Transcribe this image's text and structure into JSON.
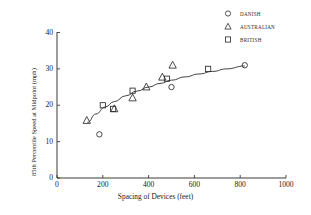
{
  "chart_data": {
    "type": "scatter",
    "title": "",
    "xlabel": "Spacing of Devices (feet)",
    "ylabel": "85th Percentile Speed at Midpoint (mph)",
    "xlim": [
      0,
      1000
    ],
    "ylim": [
      0,
      40
    ],
    "xticks": [
      0,
      200,
      400,
      600,
      800,
      1000
    ],
    "yticks": [
      0,
      10,
      20,
      30,
      40
    ],
    "xtick_labels": [
      "0",
      "200",
      "400",
      "600",
      "800",
      "1000"
    ],
    "ytick_labels": [
      "0",
      "10",
      "20",
      "30",
      "40"
    ],
    "grid": false,
    "legend_position": "top-right",
    "series": [
      {
        "name": "DANISH",
        "marker": "circle",
        "points": [
          {
            "x": 185,
            "y": 12
          },
          {
            "x": 500,
            "y": 25
          },
          {
            "x": 820,
            "y": 31
          }
        ]
      },
      {
        "name": "AUSTRALIAN",
        "marker": "triangle",
        "points": [
          {
            "x": 130,
            "y": 15.8
          },
          {
            "x": 250,
            "y": 19
          },
          {
            "x": 330,
            "y": 22
          },
          {
            "x": 390,
            "y": 25
          },
          {
            "x": 460,
            "y": 27.7
          },
          {
            "x": 505,
            "y": 31
          }
        ]
      },
      {
        "name": "BRITISH",
        "marker": "square",
        "points": [
          {
            "x": 200,
            "y": 20
          },
          {
            "x": 245,
            "y": 19
          },
          {
            "x": 330,
            "y": 24
          },
          {
            "x": 480,
            "y": 27.3
          },
          {
            "x": 660,
            "y": 30
          }
        ]
      }
    ],
    "fit_curve": {
      "name": "fitted-trend-curve",
      "points": [
        {
          "x": 133,
          "y": 15.3
        },
        {
          "x": 170,
          "y": 17.6
        },
        {
          "x": 210,
          "y": 19.5
        },
        {
          "x": 250,
          "y": 21.0
        },
        {
          "x": 300,
          "y": 22.6
        },
        {
          "x": 350,
          "y": 23.9
        },
        {
          "x": 400,
          "y": 25.0
        },
        {
          "x": 450,
          "y": 26.0
        },
        {
          "x": 500,
          "y": 26.9
        },
        {
          "x": 560,
          "y": 27.8
        },
        {
          "x": 620,
          "y": 28.6
        },
        {
          "x": 680,
          "y": 29.3
        },
        {
          "x": 740,
          "y": 30.0
        },
        {
          "x": 820,
          "y": 30.8
        }
      ]
    }
  },
  "legend": {
    "items": [
      {
        "label": "DANISH",
        "marker": "circle-icon"
      },
      {
        "label": "AUSTRALIAN",
        "marker": "triangle-icon"
      },
      {
        "label": "BRITISH",
        "marker": "square-icon"
      }
    ]
  },
  "colors": {
    "axis": "#3a3a3a",
    "marker": "#2b2b2b",
    "curve": "#2b2b2b",
    "background": "#ffffff"
  }
}
